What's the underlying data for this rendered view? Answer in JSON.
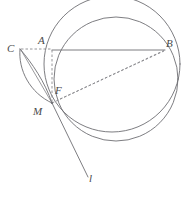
{
  "figure": {
    "kind": "geometry-diagram",
    "canvas": {
      "width": 184,
      "height": 205,
      "background": "#ffffff"
    },
    "style": {
      "stroke_color": "#6e6e73",
      "dash_color": "#8a8a8f",
      "label_color": "#4a4a4a",
      "stroke_width": 0.9,
      "dash_pattern": "2.5,2"
    },
    "labels": [
      {
        "id": "A",
        "text": "A",
        "x": 38,
        "y": 35
      },
      {
        "id": "B",
        "text": "B",
        "x": 166,
        "y": 38
      },
      {
        "id": "C",
        "text": "C",
        "x": 7,
        "y": 43
      },
      {
        "id": "F",
        "text": "F",
        "x": 55,
        "y": 85
      },
      {
        "id": "M",
        "text": "M",
        "x": 33,
        "y": 106
      },
      {
        "id": "l",
        "text": "l",
        "x": 89,
        "y": 173
      }
    ],
    "points": {
      "A": {
        "x": 52,
        "y": 50
      },
      "B": {
        "x": 165,
        "y": 50
      },
      "C": {
        "x": 20,
        "y": 49
      },
      "F": {
        "x": 52,
        "y": 96
      },
      "M": {
        "x": 52,
        "y": 103
      },
      "l_end": {
        "x": 88,
        "y": 177
      }
    },
    "circles": [
      {
        "id": "main-circle",
        "cx": 116,
        "cy": 79,
        "r": 62
      },
      {
        "id": "second-circle",
        "cx": 112,
        "cy": 64,
        "r": 68
      }
    ],
    "segments": [
      {
        "id": "AB",
        "from": "A",
        "to": "B",
        "style": "solid"
      },
      {
        "id": "AM",
        "from": "A",
        "to": "M",
        "style": "dashed"
      },
      {
        "id": "CA",
        "from": "C",
        "to": "A",
        "style": "dashed"
      },
      {
        "id": "MB",
        "from": "M",
        "to": "B",
        "style": "dashed"
      },
      {
        "id": "Ml",
        "from": "M",
        "to": "l_end",
        "style": "solid"
      },
      {
        "id": "CM",
        "from": "C",
        "to": "M",
        "style": "solid"
      }
    ],
    "arcs": [
      {
        "id": "lens-arc-outer",
        "from": "C",
        "to": "M",
        "bulge": "left"
      },
      {
        "id": "lens-arc-inner",
        "from": "C",
        "to": "M",
        "bulge": "right"
      }
    ]
  }
}
